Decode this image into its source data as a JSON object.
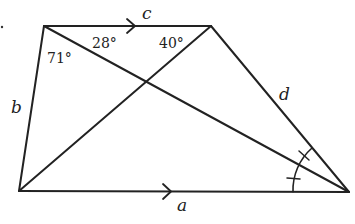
{
  "figure": {
    "type": "trapezoid-with-diagonals",
    "stroke_color": "#222222",
    "vertices": {
      "top_left": [
        44,
        26
      ],
      "top_right": [
        211,
        26
      ],
      "bottom_left": [
        19,
        191
      ],
      "bottom_right": [
        349,
        192
      ]
    },
    "side_labels": {
      "top": "c",
      "bottom": "a",
      "left": "b",
      "right": "d"
    },
    "angle_labels": [
      {
        "name": "angle-71",
        "text": "71°"
      },
      {
        "name": "angle-28",
        "text": "28°"
      },
      {
        "name": "angle-40",
        "text": "40°"
      }
    ],
    "parallel_marks": [
      "top",
      "bottom"
    ],
    "equal_angle_marks": "bisected angle at bottom-right vertex (two tick marks)"
  }
}
